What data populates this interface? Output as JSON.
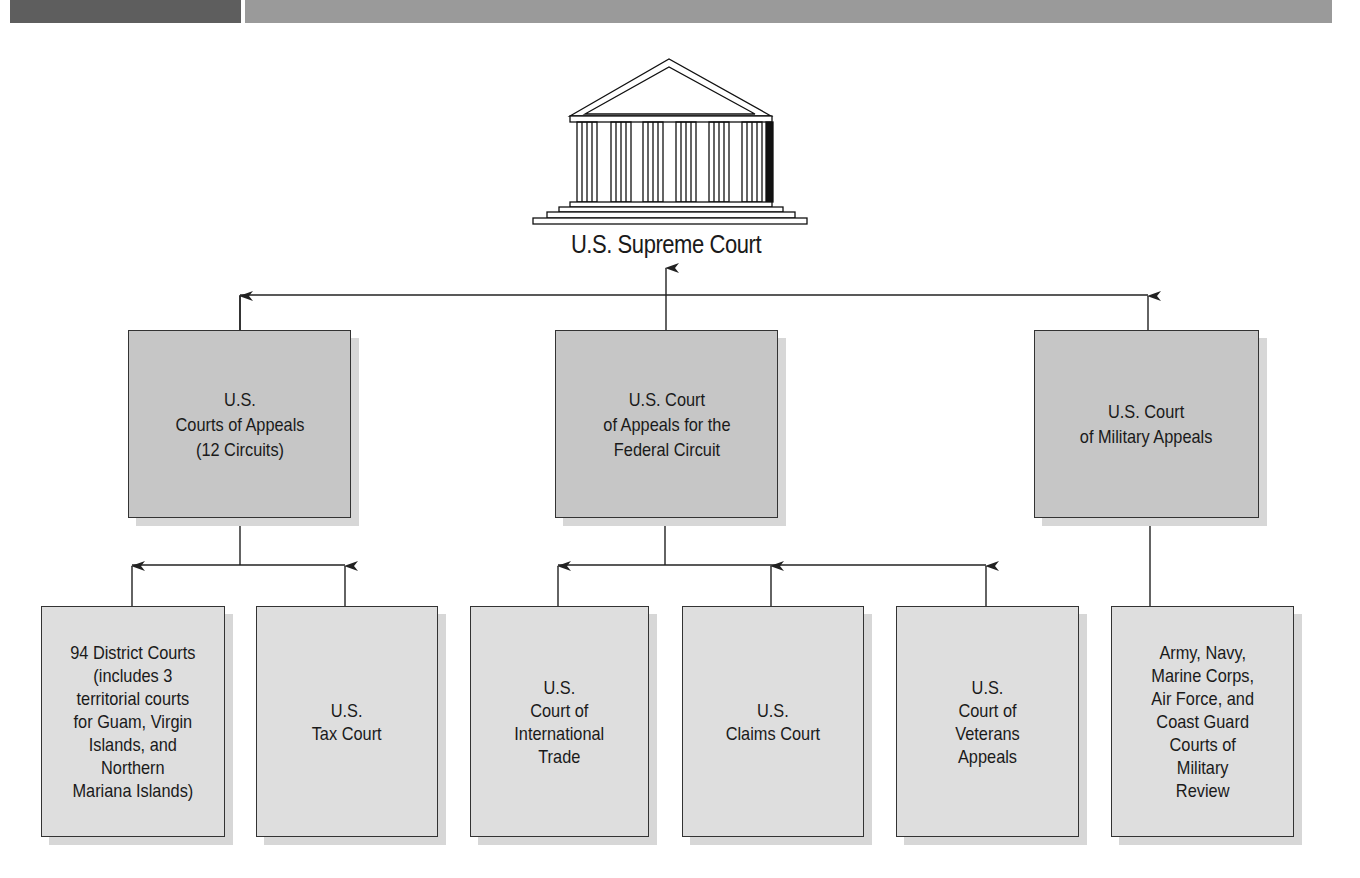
{
  "header": {
    "bar_dark_color": "#5e5e5e",
    "bar_light_color": "#9a9a9a"
  },
  "diagram": {
    "title": "U.S. Supreme Court",
    "icon": "courthouse-icon",
    "middle_tier": [
      {
        "id": "courts-of-appeals",
        "label": "U.S.\nCourts of Appeals\n(12 Circuits)"
      },
      {
        "id": "federal-circuit",
        "label": "U.S. Court\nof Appeals for the\nFederal Circuit"
      },
      {
        "id": "military-appeals",
        "label": "U.S. Court\nof Military Appeals"
      }
    ],
    "lower_tier": [
      {
        "id": "district-courts",
        "parent": "courts-of-appeals",
        "label": "94 District Courts\n(includes 3\nterritorial courts\nfor Guam, Virgin\nIslands, and\nNorthern\nMariana Islands)"
      },
      {
        "id": "tax-court",
        "parent": "courts-of-appeals",
        "label": "U.S.\nTax Court"
      },
      {
        "id": "international-trade",
        "parent": "federal-circuit",
        "label": "U.S.\nCourt of\nInternational\nTrade"
      },
      {
        "id": "claims-court",
        "parent": "federal-circuit",
        "label": "U.S.\nClaims Court"
      },
      {
        "id": "veterans-appeals",
        "parent": "federal-circuit",
        "label": "U.S.\nCourt of\nVeterans\nAppeals"
      },
      {
        "id": "military-review",
        "parent": "military-appeals",
        "label": "Army, Navy,\nMarine Corps,\nAir Force, and\nCoast Guard\nCourts of\nMilitary\nReview"
      }
    ],
    "colors": {
      "middle_box": "#c6c6c6",
      "lower_box": "#dedede",
      "shadow": "#d7d7d7",
      "line": "#222222"
    }
  }
}
